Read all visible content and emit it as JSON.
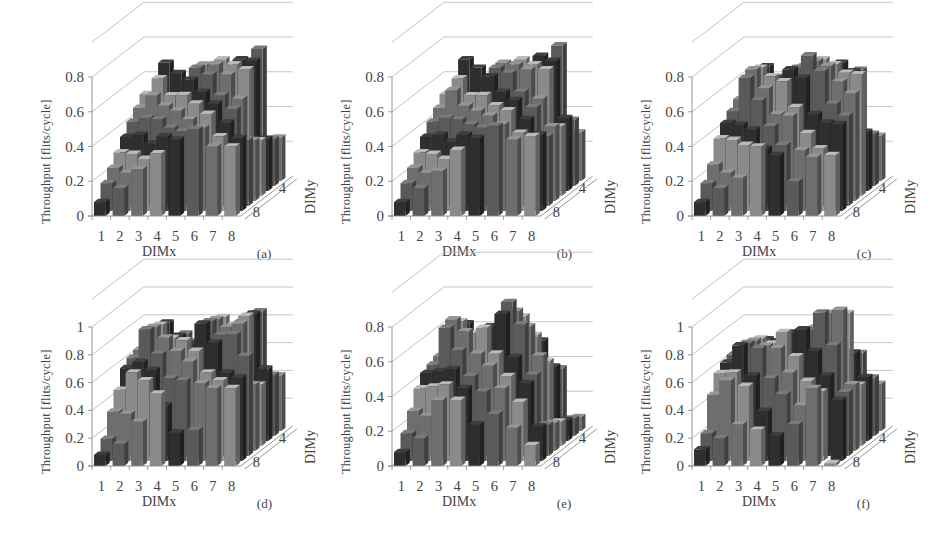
{
  "figure": {
    "x_axis_label": "DIMx",
    "y_axis_label": "Throughput  [flits/cycle]",
    "depth_axis_label": "DIMy",
    "x_ticks": [
      "1",
      "2",
      "3",
      "4",
      "5",
      "6",
      "7",
      "8"
    ],
    "depth_ticks": [
      "8",
      "4"
    ],
    "bar_shades": [
      "#2e2e2e",
      "#5a5a5a",
      "#6e6e6e",
      "#8a8a8a"
    ]
  },
  "chart_data": [
    {
      "panel": "(a)",
      "type": "bar3d",
      "xlabel": "DIMx",
      "ylabel": "Throughput  [flits/cycle]",
      "zlabel": "DIMy",
      "x": [
        1,
        2,
        3,
        4,
        5,
        6,
        7,
        8
      ],
      "y_rows_front_to_back": [
        8,
        7,
        6,
        5,
        4,
        3,
        2,
        1
      ],
      "ylim": [
        0,
        0.8
      ],
      "yticks": [
        "0",
        "0.2",
        "0.4",
        "0.6",
        "0.8"
      ],
      "values": [
        [
          0.08,
          0.16,
          0.27,
          0.36,
          0.44,
          0.5,
          0.4,
          0.4
        ],
        [
          0.16,
          0.22,
          0.3,
          0.43,
          0.46,
          0.48,
          0.43,
          0.42
        ],
        [
          0.22,
          0.3,
          0.36,
          0.45,
          0.5,
          0.53,
          0.48,
          0.38
        ],
        [
          0.28,
          0.38,
          0.47,
          0.52,
          0.56,
          0.56,
          0.53,
          0.35
        ],
        [
          0.34,
          0.45,
          0.52,
          0.58,
          0.6,
          0.58,
          0.56,
          0.32
        ],
        [
          0.4,
          0.55,
          0.55,
          0.64,
          0.67,
          0.67,
          0.7,
          0.3
        ],
        [
          0.45,
          0.62,
          0.65,
          0.68,
          0.7,
          0.7,
          0.72,
          0.27
        ],
        [
          0.5,
          0.68,
          0.56,
          0.67,
          0.7,
          0.7,
          0.76,
          0.25
        ]
      ]
    },
    {
      "panel": "(b)",
      "type": "bar3d",
      "xlabel": "DIMx",
      "ylabel": "Throughput  [flits/cycle]",
      "zlabel": "DIMy",
      "x": [
        1,
        2,
        3,
        4,
        5,
        6,
        7,
        8
      ],
      "y_rows_front_to_back": [
        8,
        7,
        6,
        5,
        4,
        3,
        2,
        1
      ],
      "ylim": [
        0,
        0.8
      ],
      "yticks": [
        "0",
        "0.2",
        "0.4",
        "0.6",
        "0.8"
      ],
      "values": [
        [
          0.08,
          0.16,
          0.26,
          0.38,
          0.45,
          0.52,
          0.44,
          0.46
        ],
        [
          0.16,
          0.22,
          0.3,
          0.44,
          0.48,
          0.5,
          0.45,
          0.44
        ],
        [
          0.22,
          0.3,
          0.37,
          0.47,
          0.52,
          0.55,
          0.5,
          0.4
        ],
        [
          0.28,
          0.38,
          0.47,
          0.52,
          0.55,
          0.58,
          0.54,
          0.43
        ],
        [
          0.34,
          0.45,
          0.52,
          0.58,
          0.6,
          0.6,
          0.56,
          0.4
        ],
        [
          0.4,
          0.58,
          0.55,
          0.66,
          0.68,
          0.7,
          0.7,
          0.42
        ],
        [
          0.45,
          0.62,
          0.68,
          0.68,
          0.7,
          0.7,
          0.72,
          0.38
        ],
        [
          0.5,
          0.7,
          0.58,
          0.68,
          0.7,
          0.72,
          0.78,
          0.28
        ]
      ]
    },
    {
      "panel": "(c)",
      "type": "bar3d",
      "xlabel": "DIMx",
      "ylabel": "Throughput  [flits/cycle]",
      "zlabel": "DIMy",
      "x": [
        1,
        2,
        3,
        4,
        5,
        6,
        7,
        8
      ],
      "y_rows_front_to_back": [
        8,
        7,
        6,
        5,
        4,
        3,
        2,
        1
      ],
      "ylim": [
        0,
        0.8
      ],
      "yticks": [
        "0",
        "0.2",
        "0.4",
        "0.6",
        "0.8"
      ],
      "values": [
        [
          0.08,
          0.16,
          0.22,
          0.4,
          0.35,
          0.2,
          0.34,
          0.35
        ],
        [
          0.16,
          0.22,
          0.38,
          0.36,
          0.38,
          0.35,
          0.36,
          0.5
        ],
        [
          0.24,
          0.38,
          0.44,
          0.46,
          0.52,
          0.42,
          0.48,
          0.52
        ],
        [
          0.36,
          0.44,
          0.58,
          0.5,
          0.54,
          0.5,
          0.56,
          0.62
        ],
        [
          0.42,
          0.68,
          0.62,
          0.66,
          0.68,
          0.72,
          0.66,
          0.7
        ],
        [
          0.46,
          0.7,
          0.66,
          0.7,
          0.78,
          0.72,
          0.68,
          0.34
        ],
        [
          0.5,
          0.68,
          0.62,
          0.68,
          0.72,
          0.7,
          0.66,
          0.3
        ],
        [
          0.5,
          0.66,
          0.6,
          0.66,
          0.7,
          0.68,
          0.64,
          0.26
        ]
      ]
    },
    {
      "panel": "(d)",
      "type": "bar3d",
      "xlabel": "DIMx",
      "ylabel": "Throughput  [flits/cycle]",
      "zlabel": "DIMy",
      "x": [
        1,
        2,
        3,
        4,
        5,
        6,
        7,
        8
      ],
      "y_rows_front_to_back": [
        8,
        7,
        6,
        5,
        4,
        3,
        2,
        1
      ],
      "ylim": [
        0,
        1
      ],
      "yticks": [
        "0",
        "0.2",
        "0.4",
        "0.6",
        "0.8",
        "1"
      ],
      "values": [
        [
          0.08,
          0.16,
          0.32,
          0.52,
          0.24,
          0.26,
          0.56,
          0.56
        ],
        [
          0.16,
          0.34,
          0.58,
          0.4,
          0.58,
          0.56,
          0.58,
          0.6
        ],
        [
          0.32,
          0.6,
          0.62,
          0.56,
          0.68,
          0.6,
          0.6,
          0.72
        ],
        [
          0.44,
          0.64,
          0.7,
          0.72,
          0.72,
          0.78,
          0.84,
          0.48
        ],
        [
          0.56,
          0.84,
          0.78,
          0.76,
          0.88,
          0.8,
          0.88,
          0.44
        ],
        [
          0.6,
          0.82,
          0.74,
          0.7,
          0.86,
          0.82,
          0.9,
          0.52
        ],
        [
          0.62,
          0.8,
          0.72,
          0.68,
          0.84,
          0.8,
          0.88,
          0.44
        ],
        [
          0.6,
          0.78,
          0.7,
          0.66,
          0.82,
          0.78,
          0.86,
          0.4
        ]
      ]
    },
    {
      "panel": "(e)",
      "type": "bar3d",
      "xlabel": "DIMx",
      "ylabel": "Throughput  [flits/cycle]",
      "zlabel": "DIMy",
      "x": [
        1,
        2,
        3,
        4,
        5,
        6,
        7,
        8
      ],
      "y_rows_front_to_back": [
        8,
        7,
        6,
        5,
        4,
        3,
        2,
        1
      ],
      "ylim": [
        0,
        0.8
      ],
      "yticks": [
        "0",
        "0.2",
        "0.4",
        "0.6",
        "0.8"
      ],
      "values": [
        [
          0.08,
          0.16,
          0.38,
          0.38,
          0.24,
          0.3,
          0.22,
          0.12
        ],
        [
          0.16,
          0.26,
          0.44,
          0.42,
          0.4,
          0.42,
          0.34,
          0.2
        ],
        [
          0.26,
          0.4,
          0.5,
          0.46,
          0.52,
          0.46,
          0.42,
          0.18
        ],
        [
          0.36,
          0.46,
          0.58,
          0.56,
          0.56,
          0.54,
          0.44,
          0.16
        ],
        [
          0.42,
          0.68,
          0.66,
          0.68,
          0.76,
          0.7,
          0.52,
          0.14
        ],
        [
          0.44,
          0.7,
          0.62,
          0.66,
          0.8,
          0.66,
          0.46,
          0.12
        ],
        [
          0.46,
          0.66,
          0.58,
          0.62,
          0.72,
          0.58,
          0.4,
          0.1
        ],
        [
          0.44,
          0.62,
          0.54,
          0.58,
          0.66,
          0.52,
          0.36,
          0.08
        ]
      ]
    },
    {
      "panel": "(f)",
      "type": "bar3d",
      "xlabel": "DIMx",
      "ylabel": "Throughput  [flits/cycle]",
      "zlabel": "DIMy",
      "x": [
        1,
        2,
        3,
        4,
        5,
        6,
        7,
        8
      ],
      "y_rows_front_to_back": [
        8,
        7,
        6,
        5,
        4,
        3,
        2,
        1
      ],
      "ylim": [
        0,
        1
      ],
      "yticks": [
        "0",
        "0.2",
        "0.4",
        "0.6",
        "0.8",
        "1"
      ],
      "values": [
        [
          0.12,
          0.2,
          0.3,
          0.26,
          0.22,
          0.3,
          0.56,
          0.02
        ],
        [
          0.2,
          0.58,
          0.54,
          0.36,
          0.48,
          0.4,
          0.5,
          0.44
        ],
        [
          0.44,
          0.6,
          0.58,
          0.56,
          0.6,
          0.54,
          0.58,
          0.46
        ],
        [
          0.56,
          0.76,
          0.74,
          0.74,
          0.68,
          0.72,
          0.76,
          0.48
        ],
        [
          0.6,
          0.74,
          0.72,
          0.82,
          0.84,
          0.96,
          0.98,
          0.44
        ],
        [
          0.62,
          0.72,
          0.7,
          0.78,
          0.8,
          0.92,
          0.92,
          0.46
        ],
        [
          0.58,
          0.7,
          0.68,
          0.74,
          0.78,
          0.88,
          0.6,
          0.42
        ],
        [
          0.54,
          0.66,
          0.64,
          0.7,
          0.74,
          0.84,
          0.56,
          0.34
        ]
      ]
    }
  ]
}
